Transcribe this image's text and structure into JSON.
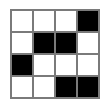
{
  "grid": {
    "rows": 4,
    "cols": 4,
    "colors": {
      "filled": "#000000",
      "empty": "#ffffff",
      "line": "#7a7a7a"
    },
    "cells": [
      [
        0,
        0,
        0,
        1
      ],
      [
        0,
        1,
        1,
        0
      ],
      [
        1,
        0,
        0,
        0
      ],
      [
        0,
        0,
        1,
        1
      ]
    ]
  }
}
